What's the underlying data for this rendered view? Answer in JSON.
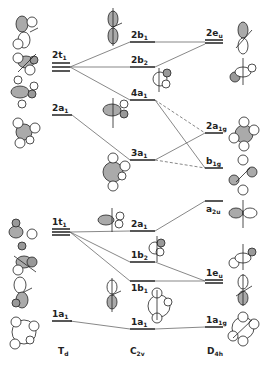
{
  "diagram": {
    "type": "Walsh correlation / molecular orbital diagram",
    "columns": [
      {
        "id": "td",
        "label_main": "T",
        "label_sub": "d"
      },
      {
        "id": "c2v",
        "label_main": "C",
        "label_sub": "2v"
      },
      {
        "id": "d4h",
        "label_main": "D",
        "label_sub": "4h"
      }
    ],
    "levels": {
      "td": [
        {
          "id": "td_2t1",
          "main": "2t",
          "sub": "1",
          "degenerate": 3
        },
        {
          "id": "td_2a1",
          "main": "2a",
          "sub": "1",
          "degenerate": 1
        },
        {
          "id": "td_1t1",
          "main": "1t",
          "sub": "1",
          "degenerate": 3
        },
        {
          "id": "td_1a1",
          "main": "1a",
          "sub": "1",
          "degenerate": 1
        }
      ],
      "c2v": [
        {
          "id": "c_2b1",
          "main": "2b",
          "sub": "1"
        },
        {
          "id": "c_2b2",
          "main": "2b",
          "sub": "2"
        },
        {
          "id": "c_4a1",
          "main": "4a",
          "sub": "1"
        },
        {
          "id": "c_3a1",
          "main": "3a",
          "sub": "1"
        },
        {
          "id": "c_2a1",
          "main": "2a",
          "sub": "1"
        },
        {
          "id": "c_1b2",
          "main": "1b",
          "sub": "2"
        },
        {
          "id": "c_1b1",
          "main": "1b",
          "sub": "1"
        },
        {
          "id": "c_1a1",
          "main": "1a",
          "sub": "1"
        }
      ],
      "d4h": [
        {
          "id": "d_2eu",
          "main": "2e",
          "sub": "u",
          "degenerate": 2
        },
        {
          "id": "d_2a1g",
          "main": "2a",
          "sub": "1g"
        },
        {
          "id": "d_b1g",
          "main": "b",
          "sub": "1g"
        },
        {
          "id": "d_a2u",
          "main": "a",
          "sub": "2u"
        },
        {
          "id": "d_1eu",
          "main": "1e",
          "sub": "u",
          "degenerate": 2
        },
        {
          "id": "d_1a1g",
          "main": "1a",
          "sub": "1g"
        }
      ]
    },
    "correlations": [
      {
        "from": "td_2t1",
        "to": "c_2b1",
        "style": "solid"
      },
      {
        "from": "td_2t1",
        "to": "c_2b2",
        "style": "solid"
      },
      {
        "from": "td_2t1",
        "to": "c_4a1",
        "style": "solid"
      },
      {
        "from": "td_2a1",
        "to": "c_3a1",
        "style": "solid"
      },
      {
        "from": "td_1t1",
        "to": "c_2a1",
        "style": "solid"
      },
      {
        "from": "td_1t1",
        "to": "c_1b2",
        "style": "solid"
      },
      {
        "from": "td_1t1",
        "to": "c_1b1",
        "style": "solid"
      },
      {
        "from": "td_1a1",
        "to": "c_1a1",
        "style": "solid"
      },
      {
        "from": "c_2b1",
        "to": "d_2eu",
        "style": "solid"
      },
      {
        "from": "c_2b2",
        "to": "d_2eu",
        "style": "solid"
      },
      {
        "from": "c_4a1",
        "to": "d_b1g",
        "style": "solid"
      },
      {
        "from": "c_4a1",
        "to": "d_2a1g",
        "style": "dashed"
      },
      {
        "from": "c_3a1",
        "to": "d_2a1g",
        "style": "solid"
      },
      {
        "from": "c_3a1",
        "to": "d_b1g",
        "style": "dashed"
      },
      {
        "from": "c_2a1",
        "to": "d_a2u",
        "style": "solid"
      },
      {
        "from": "c_1b2",
        "to": "d_1eu",
        "style": "solid"
      },
      {
        "from": "c_1b1",
        "to": "d_1eu",
        "style": "solid"
      },
      {
        "from": "c_1a1",
        "to": "d_1a1g",
        "style": "solid"
      }
    ]
  }
}
